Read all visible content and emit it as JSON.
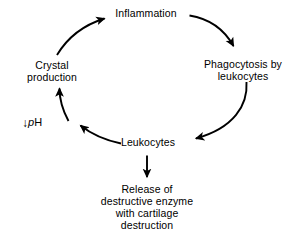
{
  "diagram": {
    "background_color": "#ffffff",
    "stroke_color": "#000000",
    "nodes": {
      "inflammation": {
        "line1": "Inflammation"
      },
      "phagocytosis": {
        "line1": "Phagocytosis by",
        "line2": "leukocytes"
      },
      "leukocytes": {
        "line1": "Leukocytes"
      },
      "release": {
        "line1": "Release of",
        "line2": "destructive enzyme",
        "line3": "with cartilage",
        "line4": "destruction"
      },
      "crystal": {
        "line1": "Crystal",
        "line2": "production"
      },
      "ph": {
        "arrow": "↓",
        "symbol_italic": "p",
        "symbol_rest": "H"
      }
    },
    "edges": [
      {
        "name": "inflammation-to-phagocytosis",
        "from": "inflammation",
        "to": "phagocytosis",
        "style": "curved"
      },
      {
        "name": "phagocytosis-to-leukocytes",
        "from": "phagocytosis",
        "to": "leukocytes",
        "style": "curved"
      },
      {
        "name": "leukocytes-to-release",
        "from": "leukocytes",
        "to": "release",
        "style": "straight"
      },
      {
        "name": "leukocytes-to-ph",
        "from": "leukocytes",
        "to": "ph",
        "style": "curved"
      },
      {
        "name": "ph-to-crystal",
        "from": "ph",
        "to": "crystal",
        "style": "curved"
      },
      {
        "name": "crystal-to-inflammation",
        "from": "crystal",
        "to": "inflammation",
        "style": "curved"
      }
    ]
  }
}
